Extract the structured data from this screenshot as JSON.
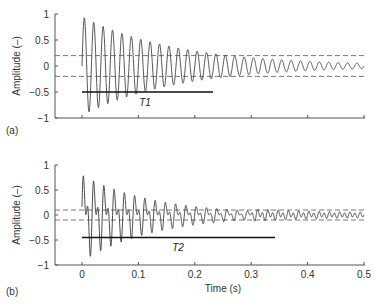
{
  "chart_data": [
    {
      "panel": "(a)",
      "type": "line",
      "xlabel": "",
      "ylabel": "Amplitude (–)",
      "xlim": [
        0,
        0.5
      ],
      "ylim": [
        -1,
        1
      ],
      "yticks": [
        "1",
        "0.5",
        "0",
        "-0.5",
        "-1"
      ],
      "xticks_labels_shown": false,
      "series": [
        {
          "name": "decaying sinusoid",
          "style": "solid",
          "frequency_hz": 60,
          "initial_amplitude": 0.95,
          "decay_time_constant_s": 0.17,
          "description": "single-frequency exponentially decaying oscillation"
        },
        {
          "name": "upper threshold",
          "style": "dashed",
          "y": 0.2
        },
        {
          "name": "lower threshold",
          "style": "dashed",
          "y": -0.2
        }
      ],
      "annotations": [
        {
          "label": "T1",
          "type": "horizontal-bar",
          "y": -0.5,
          "x_start": 0,
          "x_end": 0.23
        }
      ]
    },
    {
      "panel": "(b)",
      "type": "line",
      "xlabel": "Time (s)",
      "ylabel": "Amplitude (–)",
      "xlim": [
        0,
        0.5
      ],
      "ylim": [
        -1,
        1
      ],
      "yticks": [
        "1",
        "0.5",
        "0",
        "-0.5",
        "-1"
      ],
      "xticks": [
        "0",
        "0.1",
        "0.2",
        "0.3",
        "0.4",
        "0.5"
      ],
      "series": [
        {
          "name": "decaying beating signal",
          "style": "solid",
          "frequency_hz": 110,
          "initial_amplitude": 0.95,
          "decay_time_constant_s": 0.13,
          "description": "multi-frequency exponentially decaying oscillation with beating"
        },
        {
          "name": "upper threshold",
          "style": "dashed",
          "y": 0.1
        },
        {
          "name": "lower threshold",
          "style": "dashed",
          "y": -0.1
        }
      ],
      "annotations": [
        {
          "label": "T2",
          "type": "horizontal-bar",
          "y": -0.5,
          "x_start": 0,
          "x_end": 0.34
        }
      ]
    }
  ],
  "panels": {
    "a": {
      "label": "(a)",
      "ylabel": "Amplitude (–)",
      "bar_label": "T1",
      "yticks": [
        "1",
        "0.5",
        "0",
        "−0.5",
        "−1"
      ]
    },
    "b": {
      "label": "(b)",
      "ylabel": "Amplitude (–)",
      "bar_label": "T2",
      "yticks": [
        "1",
        "0.5",
        "0",
        "−0.5",
        "−1"
      ],
      "xticks": [
        "0",
        "0.1",
        "0.2",
        "0.3",
        "0.4",
        "0.5"
      ],
      "xlabel": "Time (s)"
    }
  }
}
